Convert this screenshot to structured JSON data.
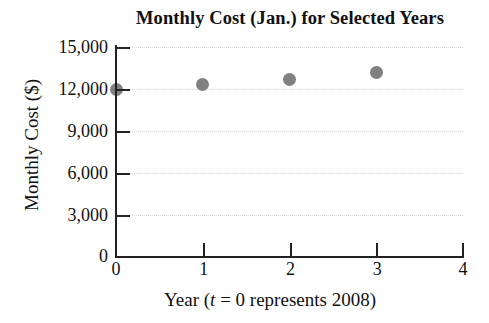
{
  "chart_data": {
    "type": "scatter",
    "title": "Monthly Cost (Jan.) for Selected Years",
    "xlabel_prefix": "Year (",
    "xlabel_italic": "t",
    "xlabel_suffix": " = 0 represents 2008)",
    "xlabel": "Year (t = 0 represents 2008)",
    "ylabel": "Monthly Cost ($)",
    "x": [
      0,
      1,
      2,
      3
    ],
    "values": [
      12000,
      12350,
      12650,
      13200
    ],
    "point_color": "#808080",
    "xlim": [
      0,
      4
    ],
    "ylim": [
      0,
      15000
    ],
    "xticks": [
      "0",
      "1",
      "2",
      "3",
      "4"
    ],
    "xtick_values": [
      0,
      1,
      2,
      3,
      4
    ],
    "yticks": [
      "0",
      "3,000",
      "6,000",
      "9,000",
      "12,000",
      "15,000"
    ],
    "ytick_values": [
      0,
      3000,
      6000,
      9000,
      12000,
      15000
    ],
    "grid": "horizontal-dotted",
    "legend": "none"
  }
}
